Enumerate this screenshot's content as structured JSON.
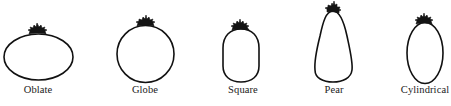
{
  "figure": {
    "stroke_color": "#111111",
    "background": "#ffffff",
    "shapes": [
      {
        "id": "oblate",
        "label": "Oblate",
        "label_x": 38
      },
      {
        "id": "globe",
        "label": "Globe",
        "label_x": 145
      },
      {
        "id": "square",
        "label": "Square",
        "label_x": 243
      },
      {
        "id": "pear",
        "label": "Pear",
        "label_x": 334
      },
      {
        "id": "cylindrical",
        "label": "Cylindrical",
        "label_x": 425
      }
    ]
  }
}
